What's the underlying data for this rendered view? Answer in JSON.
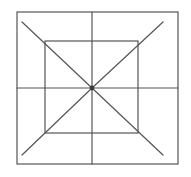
{
  "figure": {
    "canvas": {
      "width": 191,
      "height": 177,
      "background": "#ffffff"
    },
    "stroke_color": "#555555",
    "stroke_color_dark": "#3a3a3a",
    "stroke_width": 1.2,
    "outer_square": {
      "name": "outer-square",
      "left": 17,
      "top": 12,
      "right": 178,
      "bottom": 164
    },
    "inner_square": {
      "name": "inner-square",
      "left": 45,
      "top": 41,
      "right": 138,
      "bottom": 133
    },
    "center_point": {
      "x": 92,
      "y": 88,
      "radius": 2.4
    },
    "cross_lines": [
      {
        "name": "horizontal-median",
        "x1": 17,
        "y1": 88,
        "x2": 178,
        "y2": 88
      },
      {
        "name": "vertical-median",
        "x1": 92,
        "y1": 12,
        "x2": 92,
        "y2": 164
      }
    ],
    "diagonal_lines": [
      {
        "name": "diagonal-top-left-to-center",
        "x1": 22,
        "y1": 22,
        "x2": 92,
        "y2": 88
      },
      {
        "name": "diagonal-top-right-to-center",
        "x1": 163,
        "y1": 22,
        "x2": 92,
        "y2": 88
      },
      {
        "name": "diagonal-bottom-left-to-center",
        "x1": 22,
        "y1": 155,
        "x2": 92,
        "y2": 88
      },
      {
        "name": "diagonal-bottom-right-to-center",
        "x1": 163,
        "y1": 155,
        "x2": 92,
        "y2": 88
      }
    ]
  }
}
